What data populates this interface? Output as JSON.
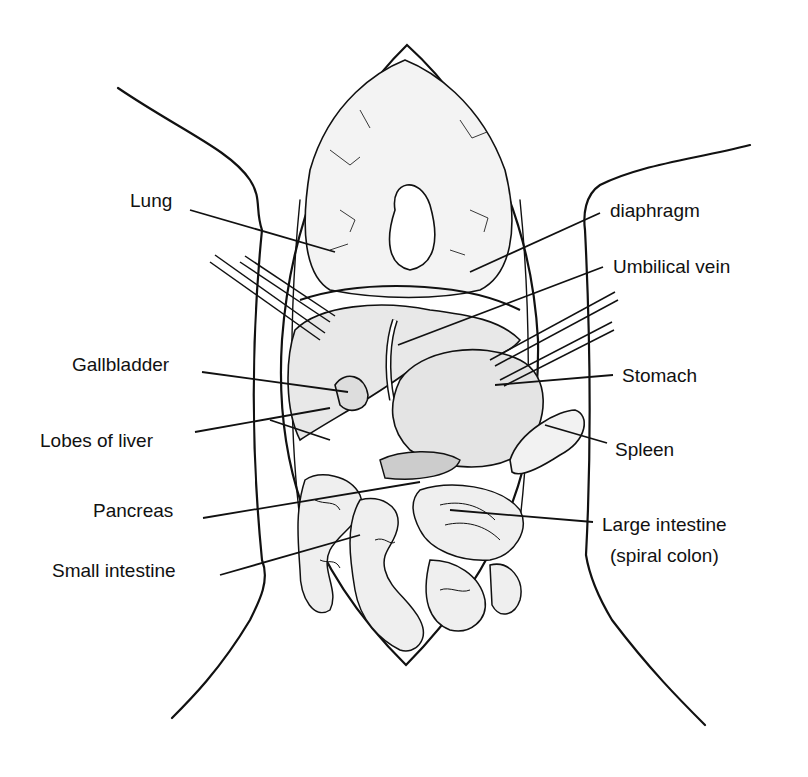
{
  "diagram": {
    "labels": {
      "left": [
        {
          "id": "lung",
          "text": "Lung"
        },
        {
          "id": "gallbladder",
          "text": "Gallbladder"
        },
        {
          "id": "lobes_of_liver",
          "text": "Lobes of liver"
        },
        {
          "id": "pancreas",
          "text": "Pancreas"
        },
        {
          "id": "small_intestine",
          "text": "Small intestine"
        }
      ],
      "right": [
        {
          "id": "diaphragm",
          "text": "diaphragm"
        },
        {
          "id": "umbilical_vein",
          "text": "Umbilical vein"
        },
        {
          "id": "stomach",
          "text": "Stomach"
        },
        {
          "id": "spleen",
          "text": "Spleen"
        },
        {
          "id": "large_intestine",
          "text": "Large intestine"
        },
        {
          "id": "large_intestine_sub",
          "text": "(spiral colon)"
        }
      ]
    }
  }
}
